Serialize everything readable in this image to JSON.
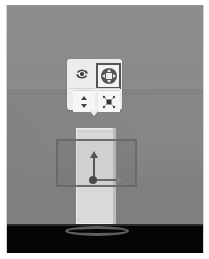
{
  "viewport": {
    "colors": {
      "wall": "#8a8a8a",
      "floor": "#050505",
      "object": "#d9d9d9",
      "selection": "#6a6a6a",
      "toolbar": "#ececec",
      "selected_border": "#555555"
    }
  },
  "toolbar": {
    "tools": [
      {
        "name": "rotate",
        "icon": "rotate-icon",
        "selected": false
      },
      {
        "name": "move",
        "icon": "move-icon",
        "selected": true
      },
      {
        "name": "height",
        "icon": "height-arrows-icon",
        "selected": false
      },
      {
        "name": "scale",
        "icon": "scale-icon",
        "selected": false
      }
    ]
  },
  "gizmo": {
    "axes": [
      "y-axis-arrow",
      "x-axis-arrow"
    ]
  }
}
